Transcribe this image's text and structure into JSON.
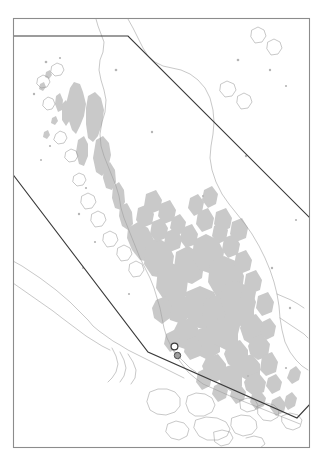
{
  "figure": {
    "kind": "reference-map",
    "region_label": "Malay Peninsula and Sumatra",
    "background_color": "#ffffff",
    "frame_color": "#8c8c8c",
    "boundary_color": "#3a3a3a",
    "landcover_color": "#c9c9c9",
    "coastline_color": "#9a9a9a"
  },
  "frame": {
    "x": 13,
    "y": 18,
    "width": 297,
    "height": 430
  },
  "map_layers": [
    {
      "name": "landcover-patches",
      "label": "Forest cover",
      "fill": "#c9c9c9",
      "visible": true
    },
    {
      "name": "coastline",
      "label": "Coastline",
      "stroke": "#9a9a9a",
      "visible": true
    },
    {
      "name": "study-boundary",
      "label": "Study area boundary",
      "stroke": "#3a3a3a",
      "visible": true
    },
    {
      "name": "site-markers",
      "label": "Sample sites",
      "visible": true
    }
  ],
  "boundary_lines": {
    "northern": "M 13 36 L 128 36 L 311 219",
    "southern": "M 13 172 L 148 352 L 297 418 L 310 404"
  },
  "site_markers": [
    {
      "name": "site-marker-open",
      "style": "open-circle",
      "cx": 174.5,
      "cy": 346.5,
      "r": 3.4
    },
    {
      "name": "site-marker-filled",
      "style": "filled-circle",
      "cx": 177.5,
      "cy": 355.5,
      "r": 3.2
    }
  ],
  "chart_data": {
    "type": "map",
    "title": "",
    "projection": "geographic",
    "extent_px": {
      "x0": 13,
      "y0": 18,
      "x1": 310,
      "y1": 448
    },
    "features": {
      "landcover_patch_count": 60,
      "coastline_path_count": 22,
      "boundary_segment_count": 2,
      "marker_count": 2
    }
  }
}
